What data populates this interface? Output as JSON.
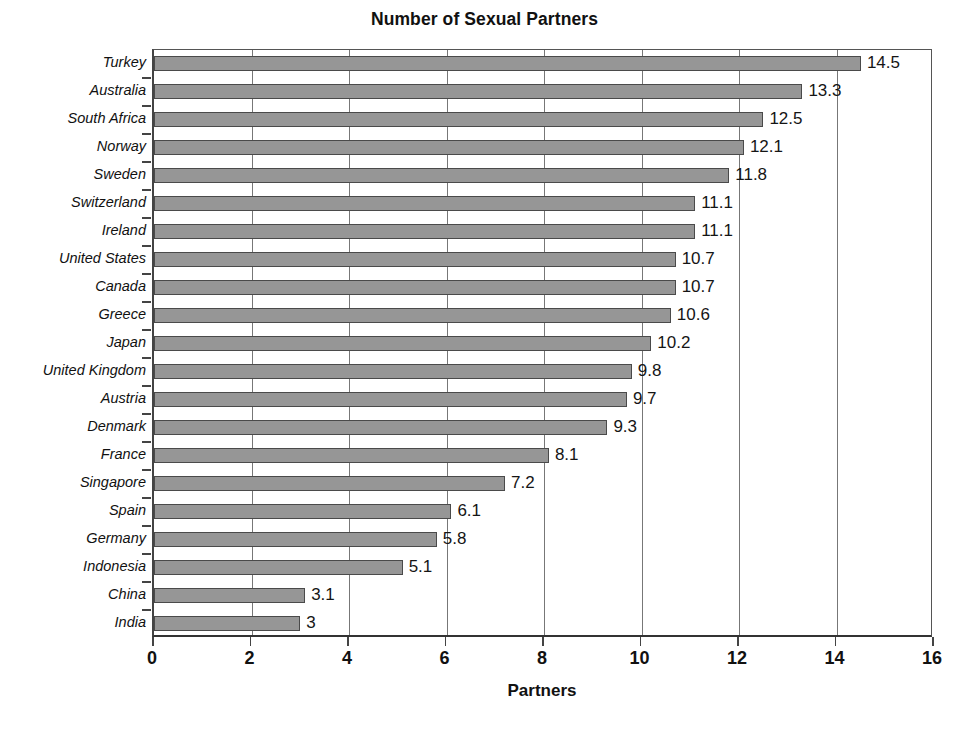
{
  "chart_data": {
    "type": "bar",
    "orientation": "horizontal",
    "title": "Number of Sexual Partners",
    "xlabel": "Partners",
    "ylabel": "",
    "xlim": [
      0,
      16
    ],
    "xticks": [
      0,
      2,
      4,
      6,
      8,
      10,
      12,
      14,
      16
    ],
    "xtick_labels": [
      "0",
      "2",
      "4",
      "6",
      "8",
      "10",
      "12",
      "14",
      "16"
    ],
    "grid": "vertical",
    "legend": "none",
    "bar_color": "#969696",
    "bar_border_color": "#4a4a4a",
    "categories": [
      "Turkey",
      "Australia",
      "South Africa",
      "Norway",
      "Sweden",
      "Switzerland",
      "Ireland",
      "United States",
      "Canada",
      "Greece",
      "Japan",
      "United Kingdom",
      "Austria",
      "Denmark",
      "France",
      "Singapore",
      "Spain",
      "Germany",
      "Indonesia",
      "China",
      "India"
    ],
    "values": [
      14.5,
      13.3,
      12.5,
      12.1,
      11.8,
      11.1,
      11.1,
      10.7,
      10.7,
      10.6,
      10.2,
      9.8,
      9.7,
      9.3,
      8.1,
      7.2,
      6.1,
      5.8,
      5.1,
      3.1,
      3
    ],
    "data_labels": [
      "14.5",
      "13.3",
      "12.5",
      "12.1",
      "11.8",
      "11.1",
      "11.1",
      "10.7",
      "10.7",
      "10.6",
      "10.2",
      "9.8",
      "9.7",
      "9.3",
      "8.1",
      "7.2",
      "6.1",
      "5.8",
      "5.1",
      "3.1",
      "3"
    ]
  }
}
